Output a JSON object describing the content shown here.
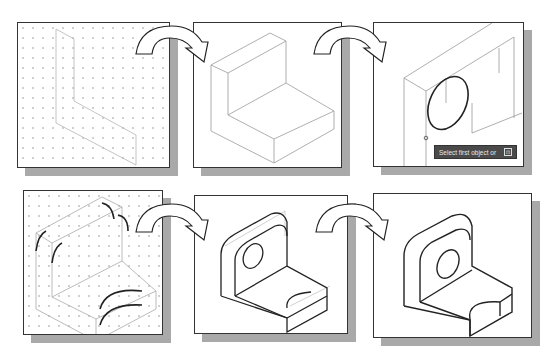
{
  "figure": {
    "steps": [
      {
        "step": 1,
        "label": "Isometric L-shaped profile on dotted isometric grid"
      },
      {
        "step": 2,
        "label": "Profile extruded into L-shaped block"
      },
      {
        "step": 3,
        "label": "Ellipse drawn on vertical face",
        "tooltip": "Select first object or",
        "tooltip_button": "⊡"
      },
      {
        "step": 4,
        "label": "Fillet arcs added to corners and cutout"
      },
      {
        "step": 5,
        "label": "Hole and cutout with construction lines"
      },
      {
        "step": 6,
        "label": "Finished bracket"
      }
    ],
    "arrow_icon": "curved-arrow-right"
  },
  "colors": {
    "panel_border": "#333333",
    "shadow": "#a9a9a9",
    "grid_dot": "#cfcfcf",
    "construction_line": "#aaaaaa",
    "object_line": "#222222",
    "tooltip_bg": "#4a4a4a"
  }
}
